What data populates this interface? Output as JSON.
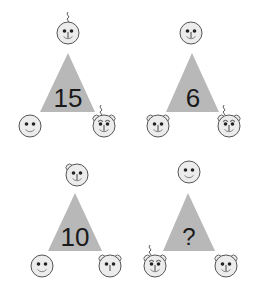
{
  "colors": {
    "triangle_fill": "#b8b8b8",
    "face_fill": "#ececec",
    "face_stroke": "#555555",
    "feature": "#222222",
    "text": "#1a1a1a"
  },
  "puzzles": [
    {
      "label": "15",
      "faces": {
        "top": {
          "features": [
            "eyes",
            "nose",
            "smile",
            "hair"
          ]
        },
        "bottom_left": {
          "features": [
            "eyes",
            "smile"
          ]
        },
        "bottom_right": {
          "features": [
            "ears",
            "eyebrows",
            "eyes",
            "nose",
            "hair"
          ]
        }
      }
    },
    {
      "label": "6",
      "faces": {
        "top": {
          "features": [
            "eyes",
            "nose",
            "smile"
          ]
        },
        "bottom_left": {
          "features": [
            "ears",
            "eyes",
            "nose",
            "smile"
          ]
        },
        "bottom_right": {
          "features": [
            "ears",
            "eyebrows",
            "eyes",
            "nose",
            "hair"
          ]
        }
      }
    },
    {
      "label": "10",
      "faces": {
        "top": {
          "features": [
            "ear",
            "eyes",
            "nose",
            "smile"
          ]
        },
        "bottom_left": {
          "features": [
            "eyes",
            "smile"
          ]
        },
        "bottom_right": {
          "features": [
            "ears",
            "eyes",
            "nose"
          ]
        }
      }
    },
    {
      "label": "?",
      "faces": {
        "top": {
          "features": [
            "eyes",
            "smile"
          ]
        },
        "bottom_left": {
          "features": [
            "ears",
            "eyebrows",
            "eyes",
            "nose",
            "smile",
            "hair"
          ]
        },
        "bottom_right": {
          "features": [
            "ears",
            "eyes",
            "nose",
            "smile"
          ]
        }
      }
    }
  ]
}
